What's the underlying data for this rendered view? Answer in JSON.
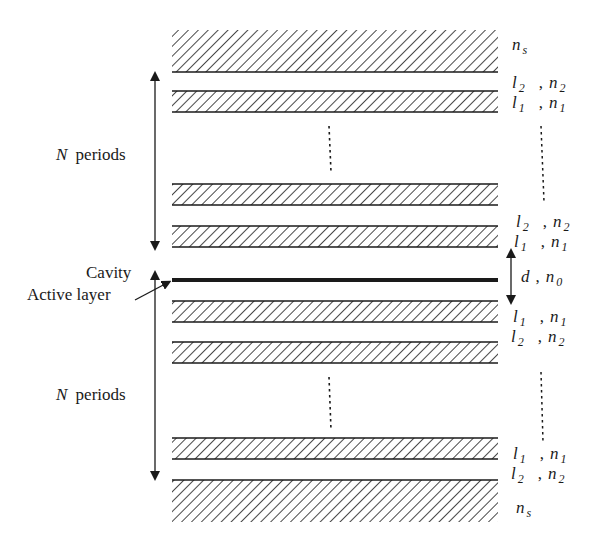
{
  "diagram": {
    "title": "",
    "type": "DBR microcavity layer stack",
    "labels": {
      "top_periods": {
        "var": "N",
        "text": "periods"
      },
      "bottom_periods": {
        "var": "N",
        "text": "periods"
      },
      "cavity": "Cavity",
      "active_layer": "Active layer"
    },
    "layer_labels": [
      {
        "id": "top-substrate",
        "symbol": "n",
        "sub": "s"
      },
      {
        "id": "top-l2",
        "l": "l",
        "l_sub": "2",
        "n": "n",
        "n_sub": "2"
      },
      {
        "id": "top-l1",
        "l": "l",
        "l_sub": "1",
        "n": "n",
        "n_sub": "1"
      },
      {
        "id": "upper-l2",
        "l": "l",
        "l_sub": "2",
        "n": "n",
        "n_sub": "2"
      },
      {
        "id": "upper-l1",
        "l": "l",
        "l_sub": "1",
        "n": "n",
        "n_sub": "1"
      },
      {
        "id": "cavity",
        "l": "d",
        "l_sub": "",
        "n": "n",
        "n_sub": "0"
      },
      {
        "id": "lower-l1",
        "l": "l",
        "l_sub": "1",
        "n": "n",
        "n_sub": "1"
      },
      {
        "id": "lower-l2",
        "l": "l",
        "l_sub": "2",
        "n": "n",
        "n_sub": "2"
      },
      {
        "id": "bottom-l1",
        "l": "l",
        "l_sub": "1",
        "n": "n",
        "n_sub": "1"
      },
      {
        "id": "bottom-l2",
        "l": "l",
        "l_sub": "2",
        "n": "n",
        "n_sub": "2"
      },
      {
        "id": "bottom-substrate",
        "symbol": "n",
        "sub": "s"
      }
    ],
    "separator": ",",
    "colors": {
      "ink": "#1a1a1a",
      "background": "#ffffff"
    }
  }
}
